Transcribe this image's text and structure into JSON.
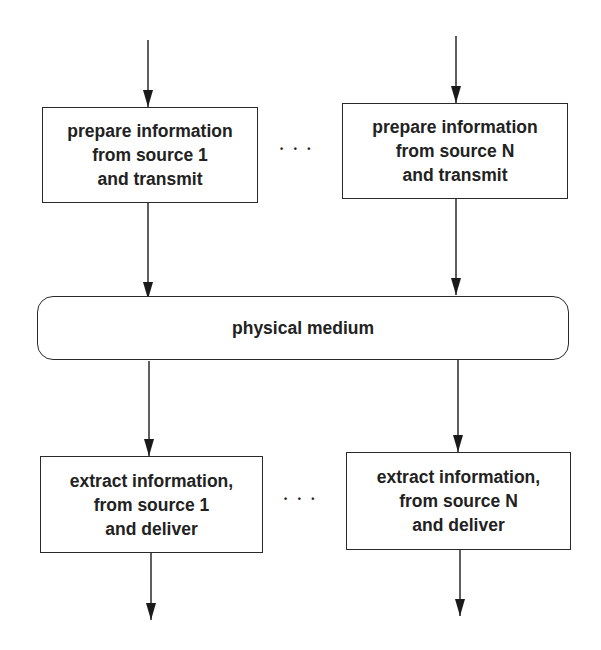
{
  "diagram": {
    "top_boxes": [
      {
        "lines": [
          "prepare information",
          "from source 1",
          "and transmit"
        ]
      },
      {
        "lines": [
          "prepare information",
          "from source N",
          "and transmit"
        ]
      }
    ],
    "top_ellipsis": "• • •",
    "medium": {
      "label": "physical medium"
    },
    "bottom_boxes": [
      {
        "lines": [
          "extract information,",
          "from source 1",
          "and deliver"
        ]
      },
      {
        "lines": [
          "extract information,",
          "from source N",
          "and deliver"
        ]
      }
    ],
    "bottom_ellipsis": "• • •",
    "colors": {
      "stroke": "#2a2a2a",
      "text": "#222222",
      "background": "#ffffff"
    }
  }
}
